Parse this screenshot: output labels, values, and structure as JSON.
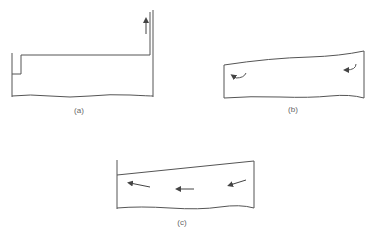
{
  "figure": {
    "panels": [
      {
        "id": "a",
        "label": "(a)",
        "description": "Rectangular tank with step at left and vertical channel at right, upward arrow"
      },
      {
        "id": "b",
        "label": "(b)",
        "description": "Tank with sloped curved free surface and two curved circulation arrows"
      },
      {
        "id": "c",
        "label": "(c)",
        "description": "Tank with linearly sloped surface and three leftward flow arrows"
      }
    ]
  },
  "colors": {
    "line": "#555555",
    "background": "#ffffff"
  }
}
